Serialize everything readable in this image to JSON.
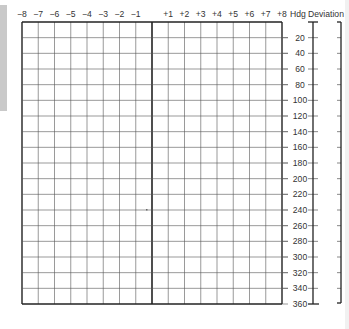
{
  "chart_data": {
    "type": "table",
    "columns": {
      "labels": [
        "-8",
        "-7",
        "-6",
        "-5",
        "-4",
        "-3",
        "-2",
        "-1",
        "",
        "+1",
        "+2",
        "+3",
        "+4",
        "+5",
        "+6",
        "+7",
        "+8"
      ],
      "range": [
        -8,
        8
      ]
    },
    "rows": {
      "header": "Hdg",
      "labels": [
        "20",
        "40",
        "60",
        "80",
        "100",
        "120",
        "140",
        "160",
        "180",
        "200",
        "220",
        "240",
        "260",
        "280",
        "300",
        "320",
        "340",
        "360"
      ],
      "range": [
        0,
        360
      ]
    },
    "deviation_header": "Deviation",
    "grid": true,
    "values": []
  },
  "colors": {
    "grid_line": "#555555",
    "frame": "#222222",
    "side_strip": "#c9c9c9"
  }
}
